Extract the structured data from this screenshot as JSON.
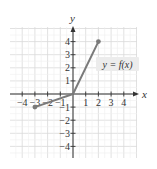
{
  "chart_data": {
    "type": "line",
    "title": "",
    "xlabel": "x",
    "ylabel": "y",
    "xlim": [
      -4.5,
      4.5
    ],
    "ylim": [
      -4.5,
      4.5
    ],
    "grid": true,
    "x_ticks": [
      -4,
      -3,
      -2,
      -1,
      1,
      2,
      3,
      4
    ],
    "y_ticks": [
      -4,
      -3,
      -2,
      -1,
      1,
      2,
      3,
      4
    ],
    "series": [
      {
        "name": "y = f(x)",
        "points": [
          [
            -3,
            -1
          ],
          [
            0,
            0
          ],
          [
            2,
            4
          ]
        ],
        "endpoints_marked": [
          [
            -3,
            -1
          ],
          [
            2,
            4
          ]
        ]
      }
    ],
    "annotations": [
      {
        "text": "y = f(x)",
        "x": 3.0,
        "y": 2.2
      }
    ],
    "legend": "none"
  },
  "colors": {
    "grid": "#d9d9d9",
    "axis": "#333333",
    "curve": "#7a7a7a",
    "label_bg": "#ececec",
    "text": "#333333"
  }
}
